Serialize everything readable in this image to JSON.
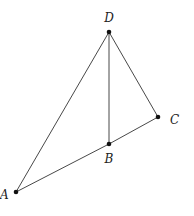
{
  "diagram": {
    "points": [
      {
        "id": "D",
        "label": "D"
      },
      {
        "id": "B",
        "label": "B"
      },
      {
        "id": "C",
        "label": "C"
      },
      {
        "id": "A",
        "label": "A"
      }
    ],
    "segments": [
      {
        "from": "A",
        "to": "D"
      },
      {
        "from": "D",
        "to": "B"
      },
      {
        "from": "D",
        "to": "C"
      },
      {
        "from": "A",
        "to": "B"
      },
      {
        "from": "B",
        "to": "C"
      }
    ]
  }
}
